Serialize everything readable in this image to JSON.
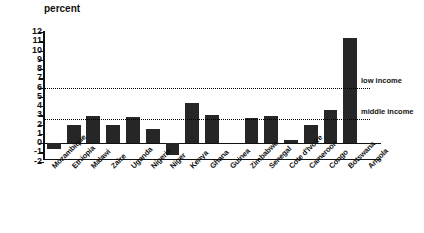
{
  "chart_data": {
    "type": "bar",
    "title": "",
    "ylabel": "percent",
    "xlabel": "",
    "ylim": [
      -2,
      12
    ],
    "yticks": [
      -2,
      -1,
      0,
      1,
      2,
      3,
      4,
      5,
      6,
      7,
      8,
      9,
      10,
      11,
      12
    ],
    "ytick_labels": [
      "-2",
      "-1",
      "0",
      "1",
      "2",
      "3",
      "4",
      "5",
      "6",
      "7",
      "8",
      "9",
      "10",
      "11",
      "12"
    ],
    "grid": false,
    "legend_position": "right-inline",
    "categories": [
      "Mozambique",
      "Ethiopia",
      "Malawi",
      "Zaire",
      "Uganda",
      "Nigeria",
      "Niger",
      "Kenya",
      "Ghana",
      "Guinea",
      "Zimbabwe",
      "Senegal",
      "Cote d'Ivoire",
      "Cameroon",
      "Congo",
      "Botswana",
      "Angola"
    ],
    "values": [
      -0.7,
      1.9,
      2.9,
      1.9,
      2.8,
      1.5,
      -1.3,
      4.3,
      3.0,
      0,
      2.7,
      2.9,
      0.3,
      2.0,
      3.6,
      11.4,
      0
    ],
    "series": [
      {
        "name": "annual growth",
        "values": [
          -0.7,
          1.9,
          2.9,
          1.9,
          2.8,
          1.5,
          -1.3,
          4.3,
          3.0,
          0,
          2.7,
          2.9,
          0.3,
          2.0,
          3.6,
          11.4,
          0
        ],
        "color": "#262626"
      }
    ],
    "reference_lines": [
      {
        "label": "low income",
        "value": 6.0,
        "style": "dotted"
      },
      {
        "label": "middle income",
        "value": 2.6,
        "style": "dotted"
      }
    ]
  },
  "colors": {
    "bar": "#262626",
    "axis": "#111111",
    "background": "#ffffff"
  }
}
